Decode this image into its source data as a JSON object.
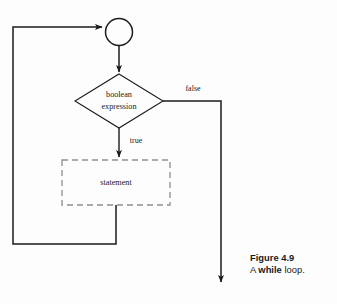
{
  "figure": {
    "kind": "flowchart",
    "background_color": "#fdfdfd",
    "ink_color": "#1b1b1b"
  },
  "nodes": {
    "entry_circle": {
      "label": "",
      "shape": "circle",
      "cx": 119,
      "cy": 32,
      "r": 13.5
    },
    "condition": {
      "label_line1": "boolean",
      "label_line2": "expression",
      "shape": "diamond",
      "cx": 119,
      "cy": 101,
      "half_width": 44,
      "half_height": 27
    },
    "statement": {
      "label": "statement",
      "shape": "dashed-rectangle",
      "x": 62,
      "y": 160,
      "width": 108,
      "height": 45
    }
  },
  "edges": {
    "true_label": "true",
    "false_label": "false",
    "loop_back_left_x": 13,
    "loop_back_bottom_y": 244,
    "false_branch_x": 221,
    "false_branch_end_y": 286
  },
  "caption": {
    "line1": "Figure 4.9",
    "line2_prefix": "A ",
    "line2_keyword": "while",
    "line2_suffix": " loop."
  }
}
